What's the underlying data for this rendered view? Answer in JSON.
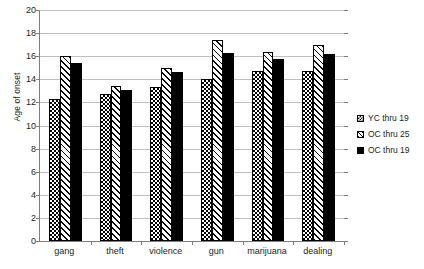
{
  "chart_data": {
    "type": "bar",
    "title": "",
    "xlabel": "",
    "ylabel": "Age of onset",
    "ylim": [
      0,
      20
    ],
    "ytick_step": 2,
    "yticks": [
      0,
      2,
      4,
      6,
      8,
      10,
      12,
      14,
      16,
      18,
      20
    ],
    "grid": true,
    "legend_position": "right",
    "categories": [
      "gang",
      "theft",
      "violence",
      "gun",
      "marijuana",
      "dealing"
    ],
    "series": [
      {
        "name": "YC thru 19",
        "pattern": "checkerboard",
        "color": "#000000",
        "values": [
          12.3,
          12.7,
          13.3,
          14.0,
          14.7,
          14.7
        ]
      },
      {
        "name": "OC thru 25",
        "pattern": "diagonal-hatch",
        "color": "#000000",
        "values": [
          16.0,
          13.4,
          15.0,
          17.4,
          16.4,
          17.0
        ]
      },
      {
        "name": "OC thru 19",
        "pattern": "solid",
        "color": "#000000",
        "values": [
          15.4,
          13.1,
          14.6,
          16.3,
          15.8,
          16.2
        ]
      }
    ]
  },
  "axis": {
    "y_title": "Age of onset"
  },
  "colors": {
    "gridline": "#bfbfbf",
    "axis": "#7f7f7f",
    "text": "#231f20",
    "background": "#ffffff"
  }
}
